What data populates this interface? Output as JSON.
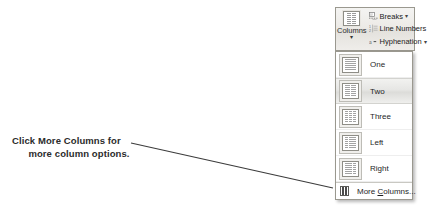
{
  "callout": {
    "line1": "Click More Columns for",
    "line2": "more column options.",
    "emphasis": "More Columns"
  },
  "ribbon": {
    "columns_button": {
      "label": "Columns",
      "caret": "▾",
      "icon": "columns-icon"
    },
    "commands": [
      {
        "label": "Breaks",
        "caret": "▾",
        "icon": "page-break-icon",
        "has_caret": true
      },
      {
        "label": "Line Numbers",
        "caret": "",
        "icon": "line-numbers-icon",
        "has_caret": false
      },
      {
        "label": "Hyphenation",
        "caret": "▾",
        "icon": "hyphenation-icon",
        "has_caret": true
      }
    ]
  },
  "menu": {
    "items": [
      {
        "label": "One",
        "columns": 1,
        "selected": false
      },
      {
        "label": "Two",
        "columns": 2,
        "selected": true
      },
      {
        "label": "Three",
        "columns": 3,
        "selected": false
      },
      {
        "label": "Left",
        "columns": 2,
        "selected": false
      },
      {
        "label": "Right",
        "columns": 2,
        "selected": false
      }
    ],
    "more": {
      "prefix": "More ",
      "accel": "C",
      "suffix": "olumns..."
    }
  },
  "leader_line": {
    "x1": 131,
    "y1": 143,
    "x2": 333,
    "y2": 188,
    "color": "#3b3b3b"
  },
  "colors": {
    "page_background": "#ffffff",
    "panel_border": "#9a988f",
    "text": "#1f1f1f",
    "callout_text": "#2b2b2b",
    "selected_row": "#e4e4e1"
  }
}
